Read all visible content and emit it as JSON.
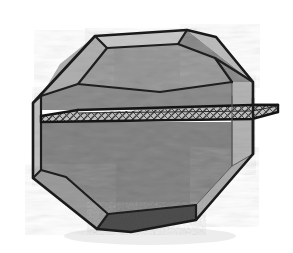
{
  "figure": {
    "title": "Truncated cube intersected by a horizontal cutting plane",
    "canvas": {
      "width": 293,
      "height": 253,
      "background": "#ffffff"
    }
  },
  "palette": {
    "background": "#ffffff",
    "outline": "#1a1a1a",
    "hidden_edge": "#555555",
    "face_top": "#c4c4c4",
    "face_top_bevel": "#b0b0b0",
    "face_front_upper": "#bcbcbc",
    "face_front_lower": "#b6b6b6",
    "face_left": "#c2c2c2",
    "face_left_bevel": "#a0a0a0",
    "face_right_bevel": "#b4b4b4",
    "face_corner_upper_right": "#b8b8b8",
    "face_corner_lower_left": "#9c9c9c",
    "face_corner_lower_right": "#adadad",
    "face_bottom": "#4f4f4f",
    "plane_fill": "#b9b9b9",
    "plane_edge": "#141414",
    "plane_hatch": "#3c3c3c",
    "texture_light": "#cfcfcf",
    "texture_dark": "#a6a6a6"
  },
  "solid": {
    "name": "chamfered-cube",
    "silhouette_sides": 8,
    "faces": [
      {
        "id": "top",
        "label": "Top face",
        "shade": "#c4c4c4"
      },
      {
        "id": "top-left-bevel",
        "label": "Upper left bevel",
        "shade": "#b0b0b0"
      },
      {
        "id": "corner-upper-right",
        "label": "Upper right corner facet",
        "shade": "#b8b8b8"
      },
      {
        "id": "front-upper",
        "label": "Front face above plane",
        "shade": "#bcbcbc"
      },
      {
        "id": "front-lower",
        "label": "Front face below plane",
        "shade": "#b6b6b6"
      },
      {
        "id": "left",
        "label": "Left side face",
        "shade": "#c2c2c2"
      },
      {
        "id": "corner-lower-left",
        "label": "Lower left corner facet",
        "shade": "#9c9c9c"
      },
      {
        "id": "corner-lower-right",
        "label": "Lower right corner facet",
        "shade": "#adadad"
      },
      {
        "id": "bottom",
        "label": "Bottom face (shadowed)",
        "shade": "#4f4f4f"
      },
      {
        "id": "right",
        "label": "Right side face",
        "shade": "#b4b4b4"
      }
    ]
  },
  "cutting_plane": {
    "name": "cutting-plane",
    "label": "Horizontal cutting plane",
    "style": "hatched slab",
    "hatch_pattern": "diagonal cross-hatch",
    "protrudes_right": true,
    "thickness_px": 7
  },
  "labels": {
    "visible_text": []
  }
}
